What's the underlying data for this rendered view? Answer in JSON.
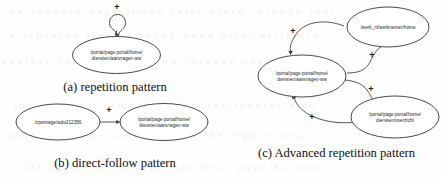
{
  "figure": {
    "background_color": "#fdfdfc",
    "ink_color": "#2a2a2a",
    "panels": [
      {
        "id": "a",
        "caption": "(a) repetition pattern",
        "nodes": [
          {
            "id": "a-n1",
            "label_line1": "/portal/page:portal/home/",
            "label_line2": "diensten/aanvragen-ww"
          }
        ],
        "edges": [
          {
            "id": "a-e1",
            "from": "a-n1",
            "to": "a-n1",
            "label": "+",
            "kind": "self-loop"
          }
        ]
      },
      {
        "id": "b",
        "caption": "(b) direct-follow pattern",
        "nodes": [
          {
            "id": "b-n1",
            "label_line1": "/xpsimage/wdo212356",
            "label_line2": ""
          },
          {
            "id": "b-n2",
            "label_line1": "/portal/page:portal/home/",
            "label_line2": "diensten/aanvragen-ww"
          }
        ],
        "edges": [
          {
            "id": "b-e1",
            "from": "b-n1",
            "to": "b-n2",
            "label": "+",
            "kind": "straight"
          }
        ]
      },
      {
        "id": "c",
        "caption": "(c) Advanced repetition pattern",
        "nodes": [
          {
            "id": "c-n1",
            "label_line1": "/werk_nl/werknemer/home",
            "label_line2": ""
          },
          {
            "id": "c-n2",
            "label_line1": "/portal/page:portal/home/",
            "label_line2": "diensten/aanvragen-ww"
          },
          {
            "id": "c-n3",
            "label_line1": "/portal/page:portal/home/",
            "label_line2": "diensten/overzicht"
          }
        ],
        "edges": [
          {
            "id": "c-e1",
            "from": "c-n1",
            "to": "c-n2",
            "label": "+",
            "kind": "curve"
          },
          {
            "id": "c-e2",
            "from": "c-n2",
            "to": "c-n1",
            "label": "+",
            "kind": "curve"
          },
          {
            "id": "c-e3",
            "from": "c-n2",
            "to": "c-n3",
            "label": "+",
            "kind": "curve"
          },
          {
            "id": "c-e4",
            "from": "c-n3",
            "to": "c-n2",
            "label": "+",
            "kind": "curve"
          }
        ]
      }
    ]
  },
  "ghost_text": {
    "rows": [
      "the scanned page shows faint bleed through text",
      "a repeated line of background print artifacts",
      "another faint row of show through characters",
      "low contrast remnants from the reverse side",
      "more ghosted words beneath the figure area",
      "trailing bleed through line near page bottom"
    ]
  }
}
